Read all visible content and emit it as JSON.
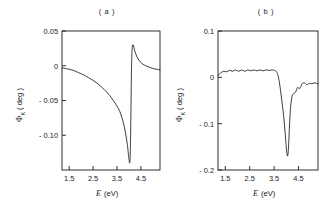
{
  "figure": {
    "background_color": "#ffffff",
    "line_color": "#1a1a1a",
    "panels": [
      {
        "id": "a",
        "label": "( a )",
        "xlabel_symbol": "E",
        "xlabel_unit": "(eV)",
        "ylabel_symbol": "Φ",
        "ylabel_subscript": "K",
        "ylabel_unit": "( deg )",
        "xticks": [
          "1.5",
          "2.5",
          "3.5",
          "4.5"
        ],
        "yticks": [
          "0.05",
          "0",
          "- 0.05",
          "- 0.10"
        ]
      },
      {
        "id": "b",
        "label": "( b )",
        "xlabel_symbol": "E",
        "xlabel_unit": "(eV)",
        "ylabel_symbol": "Φ",
        "ylabel_subscript": "K",
        "ylabel_unit": "( deg )",
        "xticks": [
          "1.5",
          "2.5",
          "3.5",
          "4.5"
        ],
        "yticks": [
          "0.1",
          "0",
          "- 0.1",
          "- 0.2"
        ]
      }
    ]
  },
  "chart_data": [
    {
      "type": "line",
      "panel": "a",
      "title": "( a )",
      "xlabel": "E (eV)",
      "ylabel": "ΦK ( deg )",
      "xlim": [
        1.2,
        5.3
      ],
      "ylim": [
        -0.15,
        0.05
      ],
      "xticks": [
        1.5,
        2.5,
        3.5,
        4.5
      ],
      "yticks": [
        0.05,
        0,
        -0.05,
        -0.1
      ],
      "grid": false,
      "legend": false,
      "series": [
        {
          "name": "Kerr rotation",
          "x": [
            1.2,
            1.35,
            1.5,
            1.7,
            1.9,
            2.1,
            2.3,
            2.5,
            2.7,
            2.9,
            3.05,
            3.2,
            3.35,
            3.5,
            3.62,
            3.72,
            3.8,
            3.88,
            3.94,
            3.98,
            4.01,
            4.03,
            4.05,
            4.07,
            4.09,
            4.11,
            4.14,
            4.18,
            4.24,
            4.32,
            4.42,
            4.55,
            4.7,
            4.85,
            5.0,
            5.15,
            5.3
          ],
          "y": [
            -0.003,
            -0.004,
            -0.005,
            -0.007,
            -0.01,
            -0.013,
            -0.017,
            -0.021,
            -0.026,
            -0.032,
            -0.037,
            -0.043,
            -0.05,
            -0.058,
            -0.066,
            -0.076,
            -0.087,
            -0.101,
            -0.115,
            -0.128,
            -0.136,
            -0.14,
            -0.133,
            -0.1,
            -0.05,
            0.0,
            0.026,
            0.03,
            0.022,
            0.014,
            0.008,
            0.003,
            0.0,
            -0.002,
            -0.004,
            -0.005,
            -0.006
          ]
        }
      ]
    },
    {
      "type": "line",
      "panel": "b",
      "title": "( b )",
      "xlabel": "E (eV)",
      "ylabel": "ΦK ( deg )",
      "xlim": [
        1.2,
        5.3
      ],
      "ylim": [
        -0.2,
        0.1
      ],
      "xticks": [
        1.5,
        2.5,
        3.5,
        4.5
      ],
      "yticks": [
        0.1,
        0,
        -0.1,
        -0.2
      ],
      "grid": false,
      "legend": false,
      "series": [
        {
          "name": "Kerr rotation",
          "x": [
            1.2,
            1.3,
            1.42,
            1.55,
            1.68,
            1.8,
            1.92,
            2.05,
            2.18,
            2.3,
            2.42,
            2.55,
            2.68,
            2.8,
            2.92,
            3.05,
            3.18,
            3.3,
            3.42,
            3.52,
            3.6,
            3.66,
            3.72,
            3.78,
            3.84,
            3.9,
            3.95,
            3.99,
            4.02,
            4.05,
            4.08,
            4.11,
            4.14,
            4.18,
            4.24,
            4.3,
            4.38,
            4.46,
            4.55,
            4.65,
            4.75,
            4.85,
            4.95,
            5.05,
            5.15,
            5.3
          ],
          "y": [
            0.004,
            0.009,
            0.013,
            0.012,
            0.015,
            0.013,
            0.016,
            0.013,
            0.016,
            0.013,
            0.016,
            0.014,
            0.016,
            0.014,
            0.016,
            0.014,
            0.016,
            0.015,
            0.016,
            0.015,
            0.012,
            0.004,
            -0.012,
            -0.035,
            -0.06,
            -0.088,
            -0.118,
            -0.145,
            -0.162,
            -0.17,
            -0.16,
            -0.13,
            -0.095,
            -0.062,
            -0.04,
            -0.035,
            -0.032,
            -0.022,
            -0.024,
            -0.014,
            -0.012,
            -0.016,
            -0.013,
            -0.014,
            -0.012,
            -0.014
          ]
        }
      ]
    }
  ]
}
